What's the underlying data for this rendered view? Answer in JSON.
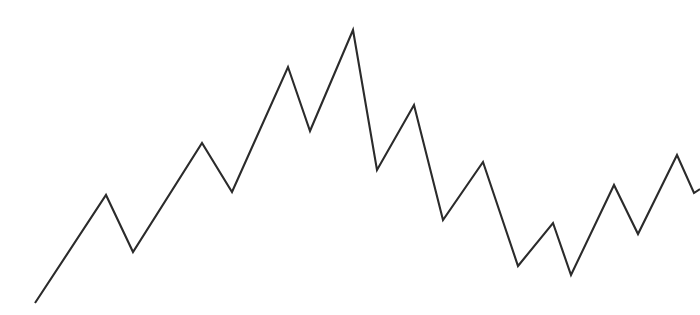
{
  "page": {
    "background_color": "#ffffff",
    "width": 700,
    "height": 315
  },
  "chart_data": {
    "type": "line",
    "title": "",
    "subtitle": "",
    "xlabel": "",
    "ylabel": "",
    "grid": false,
    "legend": false,
    "legend_position": "none",
    "axes_visible": false,
    "tick_labels_x": [],
    "tick_labels_y": [],
    "annotations": [],
    "xlim": [
      0,
      19
    ],
    "ylim": [
      0,
      315
    ],
    "series": [
      {
        "name": "series-1",
        "color": "#2b2b2b",
        "line_width": 2.1,
        "x": [
          0,
          1,
          2,
          3,
          4,
          5,
          6,
          7,
          8,
          9,
          10,
          11,
          12,
          13,
          14,
          15,
          16,
          17,
          18,
          19
        ],
        "values": [
          12,
          120,
          63,
          172,
          123,
          248,
          184,
          285,
          145,
          210,
          95,
          153,
          49,
          92,
          40,
          130,
          81,
          160,
          122,
          126
        ],
        "points_px": [
          [
            35,
            303
          ],
          [
            106,
            195
          ],
          [
            133,
            252
          ],
          [
            202,
            143
          ],
          [
            232,
            192
          ],
          [
            288,
            67
          ],
          [
            310,
            131
          ],
          [
            353,
            30
          ],
          [
            377,
            170
          ],
          [
            414,
            105
          ],
          [
            443,
            220
          ],
          [
            483,
            162
          ],
          [
            518,
            266
          ],
          [
            553,
            223
          ],
          [
            571,
            275
          ],
          [
            614,
            185
          ],
          [
            638,
            234
          ],
          [
            677,
            155
          ],
          [
            694,
            193
          ],
          [
            700,
            189
          ]
        ]
      }
    ]
  }
}
